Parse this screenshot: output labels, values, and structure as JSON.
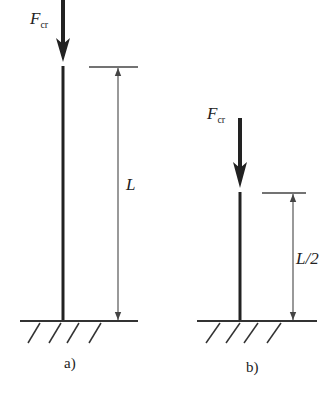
{
  "figure": {
    "panel_a": {
      "caption": "a)",
      "force_label": "F",
      "force_subscript": "cr",
      "length_label": "L"
    },
    "panel_b": {
      "caption": "b)",
      "force_label": "F",
      "force_subscript": "cr",
      "length_label": "L/2"
    },
    "colors": {
      "stroke": "#222222",
      "dimension": "#555555"
    }
  }
}
